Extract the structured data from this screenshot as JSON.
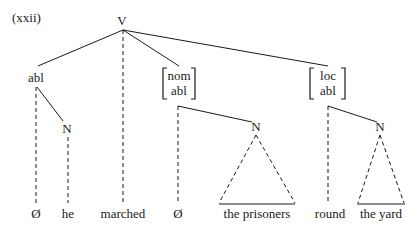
{
  "example_number": "(xxii)",
  "tree": {
    "root": "V",
    "nodes": {
      "abl": "abl",
      "nom_abl_top": "nom",
      "nom_abl_bottom": "abl",
      "loc_abl_top": "loc",
      "loc_abl_bottom": "abl",
      "n_left": "N",
      "n_middle": "N",
      "n_right": "N"
    },
    "leaves": {
      "null_1": "Ø",
      "he": "he",
      "marched": "marched",
      "null_2": "Ø",
      "the_prisoners": "the prisoners",
      "round": "round",
      "the_yard": "the yard"
    }
  }
}
